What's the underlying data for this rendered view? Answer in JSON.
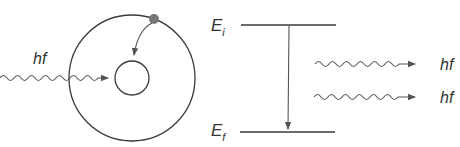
{
  "diagram": {
    "type": "stimulated-emission",
    "colors": {
      "line": "#3a3a3a",
      "wave": "#555555",
      "electron": "#777777",
      "label": "#333333",
      "background": "#ffffff"
    },
    "atom": {
      "incoming_photon_label": "hf",
      "outer_orbit": "outer-orbit",
      "inner_orbit": "inner-orbit",
      "electron": "electron"
    },
    "energy_levels": {
      "initial_label": "E",
      "initial_subscript": "i",
      "final_label": "E",
      "final_subscript": "f"
    },
    "emitted_photons": [
      {
        "label": "hf"
      },
      {
        "label": "hf"
      }
    ]
  }
}
